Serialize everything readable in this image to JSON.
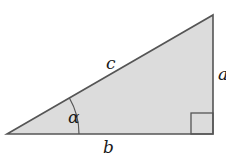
{
  "diagram": {
    "type": "right-triangle",
    "fill_color": "#dcdcdc",
    "stroke_color": "#555555",
    "labels": {
      "hypotenuse": "c",
      "opposite": "a",
      "adjacent": "b",
      "angle": "α"
    },
    "right_angle_marker": true
  }
}
